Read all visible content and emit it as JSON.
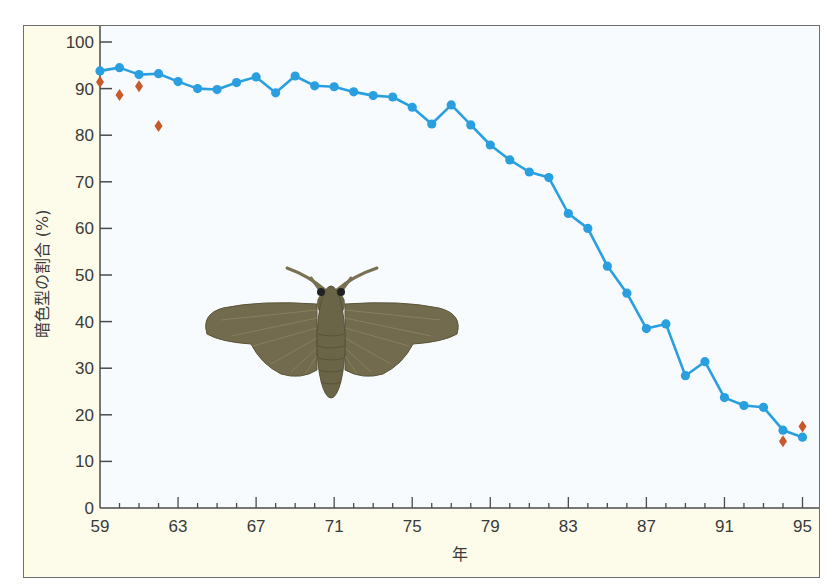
{
  "chart_data": {
    "type": "line",
    "title": "",
    "xlabel": "年",
    "ylabel": "暗色型の割合 (%)",
    "ylim": [
      0,
      100
    ],
    "xlim": [
      59,
      95
    ],
    "grid": false,
    "legend": null,
    "y_ticks": [
      0,
      10,
      20,
      30,
      40,
      50,
      60,
      70,
      80,
      90,
      100
    ],
    "x_ticks": [
      59,
      63,
      67,
      71,
      75,
      79,
      83,
      87,
      91,
      95
    ],
    "x_minor_ticks_every": 1,
    "series": [
      {
        "name": "暗色型の割合",
        "style": "line-with-circle-markers",
        "color": "#2a9fe0",
        "x": [
          59,
          60,
          61,
          62,
          63,
          64,
          65,
          66,
          67,
          68,
          69,
          70,
          71,
          72,
          73,
          74,
          75,
          76,
          77,
          78,
          79,
          80,
          81,
          82,
          83,
          84,
          85,
          86,
          87,
          88,
          89,
          90,
          91,
          92,
          93,
          94,
          95
        ],
        "values": [
          93.8,
          94.5,
          93.0,
          93.2,
          91.5,
          90.0,
          89.8,
          91.3,
          92.5,
          89.1,
          92.7,
          90.6,
          90.4,
          89.3,
          88.5,
          88.2,
          86.0,
          82.4,
          86.5,
          82.2,
          77.9,
          74.7,
          72.1,
          70.9,
          63.2,
          60.0,
          51.9,
          46.1,
          38.5,
          39.5,
          28.4,
          31.4,
          23.7,
          22.0,
          21.6,
          16.7,
          15.2
        ]
      },
      {
        "name": "別の測定値",
        "style": "diamond-markers",
        "color": "#c8592a",
        "x": [
          59,
          60,
          61,
          62,
          94,
          95
        ],
        "values": [
          91.4,
          88.6,
          90.5,
          82.0,
          14.3,
          17.5
        ]
      }
    ],
    "annotations": [
      {
        "type": "illustration",
        "subject": "moth (dark form)",
        "position": "center-left of plot"
      }
    ]
  },
  "labels": {
    "xlabel": "年",
    "ylabel": "暗色型の割合 (%)"
  },
  "colors": {
    "frame_bg": "#fdfcea",
    "plot_bg": "#f7fbfe",
    "line": "#2a9fe0",
    "diamond": "#c8592a",
    "axis": "#4a4a4a",
    "moth_body": "#6b6548",
    "moth_wing": "#736b4d"
  }
}
